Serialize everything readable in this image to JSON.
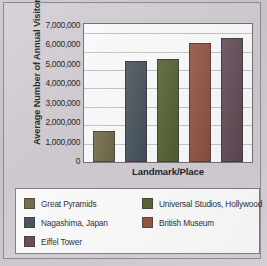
{
  "chart_data": {
    "type": "bar",
    "title": "",
    "xlabel": "Landmark/Place",
    "ylabel": "Average Number of Annual Visitors",
    "categories": [
      "Great Pyramids",
      "Nagashima, Japan",
      "Universal Studios, Hollywood",
      "British Museum",
      "Eiffel Tower"
    ],
    "values": [
      1700000,
      5500000,
      5600000,
      6450000,
      6750000
    ],
    "ylim": [
      0,
      7500000
    ],
    "ytick_values": [
      0,
      1000000,
      2000000,
      3000000,
      4000000,
      5000000,
      6000000,
      7000000
    ],
    "ytick_labels": [
      "0",
      "1,000,000",
      "2,000,000",
      "3,000,000",
      "4,000,000",
      "5,000,000",
      "6,000,000",
      "7,000,000"
    ],
    "grid": true,
    "legend_position": "bottom",
    "colors": [
      "#6b6640",
      "#3f4c55",
      "#4f5c2c",
      "#8e4f3a",
      "#5d4650"
    ]
  },
  "legend": {
    "items": [
      {
        "label": "Great Pyramids",
        "color": "#6b6640"
      },
      {
        "label": "Universal Studios, Hollywood",
        "color": "#4f5c2c"
      },
      {
        "label": "Nagashima, Japan",
        "color": "#3f4c55"
      },
      {
        "label": "British Museum",
        "color": "#8e4f3a"
      },
      {
        "label": "Eiffel Tower",
        "color": "#5d4650"
      }
    ]
  }
}
